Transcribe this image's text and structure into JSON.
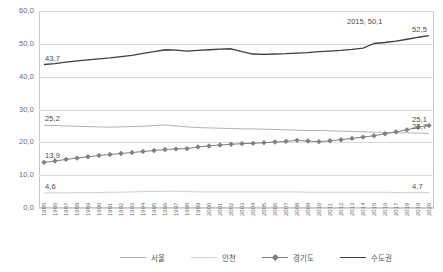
{
  "chart_data": {
    "type": "line",
    "title": "",
    "xlabel": "",
    "ylabel": "",
    "ylim": [
      0,
      60
    ],
    "ytick_values": [
      60,
      50,
      40,
      30,
      20,
      10,
      0
    ],
    "ytick_labels": [
      "60,0",
      "50,0",
      "40,0",
      "30,0",
      "20,0",
      "10,0",
      "0,0"
    ],
    "grid": true,
    "legend_position": "bottom",
    "x": [
      1985,
      1986,
      1987,
      1988,
      1989,
      1990,
      1991,
      1992,
      1993,
      1994,
      1995,
      1996,
      1997,
      1998,
      1999,
      2000,
      2001,
      2002,
      2003,
      2004,
      2005,
      2006,
      2007,
      2008,
      2009,
      2010,
      2011,
      2012,
      2013,
      2014,
      2015,
      2016,
      2017,
      2018,
      2019,
      2020
    ],
    "categories": [
      "1985",
      "1986",
      "1987",
      "1988",
      "1989",
      "1990",
      "1991",
      "1992",
      "1993",
      "1994",
      "1995",
      "1996",
      "1997",
      "1998",
      "1999",
      "2000",
      "2001",
      "2002",
      "2003",
      "2004",
      "2005",
      "2006",
      "2007",
      "2008",
      "2009",
      "2010",
      "2011",
      "2012",
      "2013",
      "2014",
      "2015",
      "2016",
      "2017",
      "2018",
      "2019",
      "2020"
    ],
    "series": [
      {
        "name": "서울",
        "color": "#b3b3b3",
        "marker": "none",
        "values": [
          25.2,
          25.1,
          25.0,
          24.9,
          24.8,
          24.7,
          24.6,
          24.7,
          24.8,
          24.9,
          25.1,
          25.3,
          25.0,
          24.7,
          24.5,
          24.4,
          24.3,
          24.2,
          24.1,
          24.1,
          24.0,
          23.9,
          23.8,
          23.7,
          23.6,
          23.6,
          23.5,
          23.4,
          23.3,
          23.2,
          23.1,
          23.0,
          22.9,
          22.9,
          22.8,
          22.7
        ]
      },
      {
        "name": "인천",
        "color": "#cfcfcf",
        "marker": "none",
        "values": [
          4.6,
          4.6,
          4.6,
          4.7,
          4.7,
          4.7,
          4.8,
          4.8,
          4.9,
          5.0,
          5.0,
          5.1,
          5.1,
          5.0,
          4.9,
          4.9,
          4.9,
          4.9,
          4.9,
          4.9,
          4.9,
          4.9,
          4.9,
          4.9,
          4.8,
          4.8,
          4.8,
          4.8,
          4.8,
          4.8,
          4.8,
          4.8,
          4.7,
          4.7,
          4.7,
          4.7
        ]
      },
      {
        "name": "경기도",
        "color": "#7f7f7f",
        "marker": "diamond",
        "values": [
          13.9,
          14.3,
          14.8,
          15.2,
          15.6,
          16.0,
          16.3,
          16.6,
          16.9,
          17.2,
          17.5,
          17.8,
          18.0,
          18.1,
          18.6,
          18.9,
          19.2,
          19.4,
          19.6,
          19.7,
          19.9,
          20.1,
          20.3,
          20.6,
          20.4,
          20.2,
          20.5,
          20.8,
          21.2,
          21.6,
          22.0,
          22.6,
          23.2,
          23.8,
          24.6,
          25.1
        ]
      },
      {
        "name": "수도권",
        "color": "#3f3f3f",
        "marker": "none",
        "values": [
          43.7,
          44.0,
          44.4,
          44.8,
          45.1,
          45.4,
          45.7,
          46.1,
          46.5,
          47.1,
          47.6,
          48.2,
          48.1,
          47.8,
          48.0,
          48.2,
          48.4,
          48.5,
          47.6,
          46.9,
          46.8,
          46.9,
          47.0,
          47.2,
          47.3,
          47.6,
          47.8,
          48.0,
          48.3,
          48.7,
          50.1,
          50.4,
          50.8,
          51.4,
          52.0,
          52.5
        ]
      }
    ],
    "point_labels": [
      {
        "text": "43,7",
        "series": "수도권",
        "x": 1985,
        "anchor": "start"
      },
      {
        "text": "25,2",
        "series": "서울",
        "x": 1985,
        "anchor": "start"
      },
      {
        "text": "13,9",
        "series": "경기도",
        "x": 1985,
        "anchor": "start"
      },
      {
        "text": "4,6",
        "series": "인천",
        "x": 1985,
        "anchor": "start"
      },
      {
        "text": "52,5",
        "series": "수도권",
        "x": 2020,
        "anchor": "end"
      },
      {
        "text": "25,1",
        "series": "경기도",
        "x": 2020,
        "anchor": "end"
      },
      {
        "text": "22,7",
        "series": "서울",
        "x": 2020,
        "anchor": "end"
      },
      {
        "text": "4,7",
        "series": "인천",
        "x": 2020,
        "anchor": "end"
      }
    ],
    "annotations": [
      {
        "text": "2015, 50,1",
        "series": "수도권",
        "x": 2015,
        "value": 50.1
      }
    ]
  }
}
